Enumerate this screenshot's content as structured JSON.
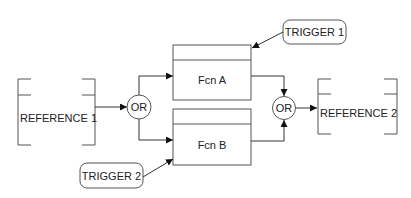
{
  "diagram": {
    "type": "function-flow",
    "nodes": {
      "reference1": {
        "label": "REFERENCE 1",
        "kind": "data-store"
      },
      "reference2": {
        "label": "REFERENCE 2",
        "kind": "data-store"
      },
      "or1": {
        "label": "OR",
        "kind": "junction"
      },
      "or2": {
        "label": "OR",
        "kind": "junction"
      },
      "fcnA": {
        "label": "Fcn A",
        "kind": "function"
      },
      "fcnB": {
        "label": "Fcn B",
        "kind": "function"
      },
      "trigger1": {
        "label": "TRIGGER 1",
        "kind": "trigger"
      },
      "trigger2": {
        "label": "TRIGGER 2",
        "kind": "trigger"
      }
    },
    "edges": [
      {
        "from": "reference1",
        "to": "or1"
      },
      {
        "from": "or1",
        "to": "fcnA"
      },
      {
        "from": "or1",
        "to": "fcnB"
      },
      {
        "from": "trigger1",
        "to": "fcnA"
      },
      {
        "from": "trigger2",
        "to": "fcnB"
      },
      {
        "from": "fcnA",
        "to": "or2"
      },
      {
        "from": "fcnB",
        "to": "or2"
      },
      {
        "from": "or2",
        "to": "reference2"
      }
    ]
  }
}
